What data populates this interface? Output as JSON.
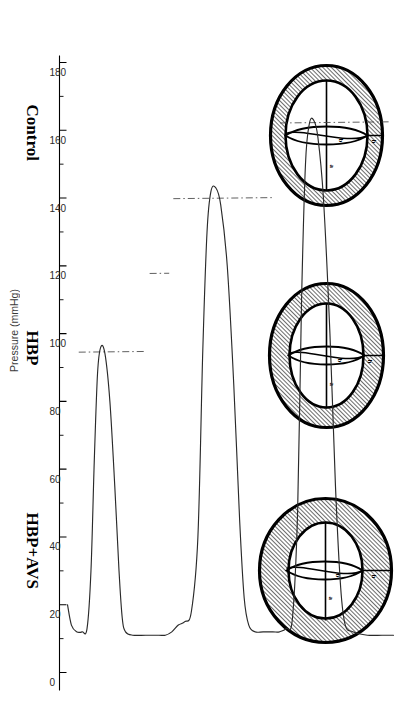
{
  "figure": {
    "title": "",
    "conditions": [
      {
        "key": "control",
        "label": "Control"
      },
      {
        "key": "hbp",
        "label": "HBP"
      },
      {
        "key": "hbp_avs",
        "label": "HBP+AVS"
      }
    ],
    "diagram_annotations": {
      "wall_thickness": "h",
      "cavity_minor": "b",
      "cavity_major": "a"
    },
    "diagrams": [
      {
        "condition": "Control",
        "wall_label": "h",
        "minor_label": "b",
        "major_label": "a"
      },
      {
        "condition": "HBP",
        "wall_label": "h",
        "minor_label": "b",
        "major_label": "a"
      },
      {
        "condition": "HBP+AVS",
        "wall_label": "h",
        "minor_label": "b",
        "major_label": "a"
      }
    ]
  },
  "chart_data": {
    "type": "line",
    "title": "",
    "xlabel": "",
    "ylabel": "Pressure (mmHg)",
    "ylim": [
      0,
      180
    ],
    "yticks": [
      0,
      20,
      40,
      60,
      80,
      100,
      120,
      140,
      160,
      180
    ],
    "ytick_labels": [
      "0",
      "20",
      "40",
      "60",
      "80",
      "100",
      "120",
      "140",
      "160",
      "180"
    ],
    "minor_tick_step": 10,
    "grid": false,
    "legend": false,
    "orientation": "pressure-axis-vertical-rotated",
    "categories": [
      "Control",
      "HBP",
      "HBP+AVS"
    ],
    "reference_lines": {
      "style": "dash-dot",
      "label": "peak systolic pressure reference",
      "values": [
        95,
        118,
        140,
        162
      ]
    },
    "series": [
      {
        "name": "Left ventricular pressure tracing",
        "style": "solid",
        "segments": [
          {
            "condition": "Control",
            "baseline": 12,
            "peak": 96,
            "points": [
              [
                0.0,
                20
              ],
              [
                0.012,
                14
              ],
              [
                0.028,
                12
              ],
              [
                0.045,
                12
              ],
              [
                0.06,
                13
              ],
              [
                0.072,
                30
              ],
              [
                0.082,
                62
              ],
              [
                0.092,
                88
              ],
              [
                0.102,
                96
              ],
              [
                0.115,
                94
              ],
              [
                0.13,
                80
              ],
              [
                0.145,
                55
              ],
              [
                0.158,
                30
              ],
              [
                0.168,
                16
              ],
              [
                0.178,
                12
              ],
              [
                0.2,
                11
              ],
              [
                0.24,
                11
              ],
              [
                0.28,
                11
              ]
            ]
          },
          {
            "condition": "HBP",
            "baseline": 14,
            "peak": 143,
            "points": [
              [
                0.3,
                11
              ],
              [
                0.32,
                12
              ],
              [
                0.34,
                14
              ],
              [
                0.36,
                15
              ],
              [
                0.38,
                18
              ],
              [
                0.4,
                40
              ],
              [
                0.415,
                95
              ],
              [
                0.428,
                130
              ],
              [
                0.44,
                142
              ],
              [
                0.455,
                143
              ],
              [
                0.47,
                138
              ],
              [
                0.49,
                120
              ],
              [
                0.51,
                85
              ],
              [
                0.528,
                45
              ],
              [
                0.542,
                22
              ],
              [
                0.556,
                14
              ],
              [
                0.575,
                12
              ],
              [
                0.6,
                12
              ],
              [
                0.63,
                12
              ]
            ]
          },
          {
            "condition": "HBP+AVS",
            "baseline": 12,
            "peak": 163,
            "points": [
              [
                0.65,
                12
              ],
              [
                0.672,
                13
              ],
              [
                0.69,
                16
              ],
              [
                0.706,
                48
              ],
              [
                0.718,
                110
              ],
              [
                0.73,
                150
              ],
              [
                0.742,
                162
              ],
              [
                0.755,
                163
              ],
              [
                0.768,
                158
              ],
              [
                0.785,
                140
              ],
              [
                0.805,
                100
              ],
              [
                0.822,
                55
              ],
              [
                0.838,
                25
              ],
              [
                0.852,
                14
              ],
              [
                0.875,
                12
              ],
              [
                0.92,
                11
              ],
              [
                0.965,
                11
              ],
              [
                1.0,
                11
              ]
            ]
          }
        ]
      }
    ]
  }
}
